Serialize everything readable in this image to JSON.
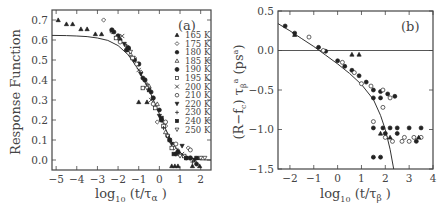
{
  "chart_data": [
    {
      "type": "scatter",
      "panel_label": "(a)",
      "xlabel": "log10 (t/τα)",
      "ylabel": "Response Function",
      "xlim": [
        -5.2,
        2.5
      ],
      "ylim": [
        -0.05,
        0.75
      ],
      "xticks": [
        -5,
        -4,
        -3,
        -2,
        -1,
        0,
        1,
        2
      ],
      "yticks": [
        0.0,
        0.1,
        0.2,
        0.3,
        0.4,
        0.5,
        0.6,
        0.7
      ],
      "ytick_labels": [
        "0.0",
        "0.1",
        "0.2",
        "0.3",
        "0.4",
        "0.5",
        "0.6",
        "0.7"
      ],
      "legend_position": "right",
      "legend": [
        "165 K",
        "175 K",
        "180 K",
        "185 K",
        "190 K",
        "195 K",
        "200 K",
        "210 K",
        "220 K",
        "230 K",
        "240 K",
        "250 K"
      ],
      "fit_curve": {
        "description": "stretched-exponential-like master curve",
        "x": [
          -5.2,
          -4.5,
          -4,
          -3.5,
          -3,
          -2.5,
          -2,
          -1.5,
          -1,
          -0.5,
          0,
          0.3,
          0.6,
          1.0,
          1.5,
          2.0,
          2.5
        ],
        "y": [
          0.623,
          0.622,
          0.62,
          0.617,
          0.61,
          0.598,
          0.572,
          0.525,
          0.45,
          0.35,
          0.23,
          0.155,
          0.09,
          0.035,
          0.008,
          0.001,
          0.0
        ]
      },
      "series": [
        {
          "name": "165 K",
          "marker": "triangle-filled",
          "points": [
            [
              -4.9,
              0.7
            ],
            [
              -4.5,
              0.68
            ],
            [
              -4.2,
              0.68
            ],
            [
              -3.8,
              0.655
            ],
            [
              -3.5,
              0.655
            ],
            [
              -3.1,
              0.63
            ],
            [
              -2.8,
              0.63
            ],
            [
              -1.0,
              0.29
            ],
            [
              -0.6,
              0.29
            ],
            [
              0.6,
              -0.03
            ],
            [
              0.75,
              -0.03
            ],
            [
              0.9,
              -0.03
            ],
            [
              1.6,
              -0.03
            ],
            [
              1.95,
              -0.03
            ]
          ]
        },
        {
          "name": "175 K",
          "marker": "diamond-open",
          "points": [
            [
              -2.7,
              0.7
            ],
            [
              -2.3,
              0.64
            ],
            [
              -1.6,
              0.57
            ],
            [
              -1.2,
              0.51
            ],
            [
              -0.9,
              0.44
            ],
            [
              -0.1,
              0.19
            ],
            [
              0.3,
              0.17
            ],
            [
              0.7,
              0.06
            ],
            [
              1.4,
              0.06
            ]
          ]
        },
        {
          "name": "180 K",
          "marker": "circle-filled",
          "points": [
            [
              -2.2,
              0.64
            ],
            [
              -1.9,
              0.6
            ],
            [
              -1.6,
              0.55
            ],
            [
              -1.2,
              0.5
            ],
            [
              -0.8,
              0.41
            ],
            [
              -0.4,
              0.34
            ],
            [
              0.0,
              0.25
            ],
            [
              0.4,
              0.12
            ],
            [
              0.8,
              0.03
            ],
            [
              1.3,
              0.01
            ],
            [
              1.8,
              -0.02
            ]
          ]
        },
        {
          "name": "185 K",
          "marker": "triangle-open",
          "points": [
            [
              -2.0,
              0.62
            ],
            [
              -1.4,
              0.53
            ],
            [
              -0.5,
              0.37
            ],
            [
              -0.1,
              0.28
            ],
            [
              0.3,
              0.14
            ],
            [
              1.0,
              0.03
            ],
            [
              1.7,
              0.0
            ]
          ]
        },
        {
          "name": "190 K",
          "marker": "hexagon-filled",
          "points": [
            [
              -2.3,
              0.65
            ],
            [
              -2.0,
              0.62
            ],
            [
              -1.5,
              0.56
            ],
            [
              -1.0,
              0.48
            ],
            [
              -0.7,
              0.4
            ],
            [
              -0.3,
              0.31
            ],
            [
              0.1,
              0.2
            ],
            [
              0.5,
              0.1
            ],
            [
              0.9,
              0.04
            ],
            [
              1.5,
              0.01
            ]
          ]
        },
        {
          "name": "195 K",
          "marker": "square-open",
          "points": [
            [
              -2.1,
              0.61
            ],
            [
              -1.3,
              0.51
            ],
            [
              -0.8,
              0.36
            ],
            [
              -0.2,
              0.26
            ],
            [
              0.2,
              0.17
            ],
            [
              0.6,
              0.06
            ],
            [
              1.2,
              0.02
            ]
          ]
        },
        {
          "name": "200 K",
          "marker": "cross",
          "points": [
            [
              -1.8,
              0.62
            ],
            [
              -1.0,
              0.45
            ],
            [
              -0.4,
              0.3
            ],
            [
              0.5,
              0.1
            ],
            [
              1.1,
              0.03
            ],
            [
              1.9,
              0.01
            ]
          ]
        },
        {
          "name": "210 K",
          "marker": "circle-open",
          "points": [
            [
              -1.9,
              0.59
            ],
            [
              -1.1,
              0.48
            ],
            [
              -0.3,
              0.28
            ],
            [
              0.3,
              0.19
            ],
            [
              0.8,
              0.08
            ],
            [
              1.5,
              0.05
            ]
          ]
        },
        {
          "name": "220 K",
          "marker": "triangle-down-filled",
          "points": [
            [
              -1.7,
              0.58
            ],
            [
              -0.9,
              0.43
            ],
            [
              0.0,
              0.22
            ],
            [
              0.6,
              0.08
            ],
            [
              1.1,
              0.07
            ],
            [
              1.7,
              0.0
            ]
          ]
        },
        {
          "name": "230 K",
          "marker": "plus",
          "points": [
            [
              -1.6,
              0.57
            ],
            [
              -0.6,
              0.38
            ],
            [
              0.2,
              0.16
            ],
            [
              0.9,
              0.05
            ],
            [
              1.6,
              -0.01
            ]
          ]
        },
        {
          "name": "240 K",
          "marker": "square-filled",
          "points": [
            [
              -1.5,
              0.55
            ],
            [
              -0.5,
              0.35
            ],
            [
              0.1,
              0.21
            ],
            [
              0.7,
              0.03
            ],
            [
              1.3,
              0.01
            ],
            [
              1.8,
              0.01
            ]
          ]
        },
        {
          "name": "250 K",
          "marker": "triangle-down-open",
          "points": [
            [
              -1.4,
              0.54
            ],
            [
              -0.6,
              0.36
            ],
            [
              0.4,
              0.12
            ],
            [
              1.0,
              0.02
            ],
            [
              2.0,
              0.01
            ],
            [
              2.2,
              0.01
            ]
          ]
        }
      ]
    },
    {
      "type": "scatter",
      "panel_label": "(b)",
      "xlabel": "log10 (t/τβ)",
      "ylabel": "(R−fc) τβ^a (ps^a)",
      "xlim": [
        -2.5,
        4
      ],
      "ylim": [
        -1.5,
        0.5
      ],
      "xticks": [
        -2,
        -1,
        0,
        1,
        2,
        3,
        4
      ],
      "yticks": [
        0.5,
        0.0,
        -0.5,
        -1.0,
        -1.5
      ],
      "ytick_labels": [
        "0.5",
        "0.0",
        "−0.5",
        "−1.0",
        "−1.5"
      ],
      "reference_line_y": 0.0,
      "fit_curve": {
        "description": "beta-relaxation critical decay master curve",
        "x": [
          -2.5,
          -2,
          -1.5,
          -1,
          -0.5,
          0,
          0.5,
          1,
          1.5,
          1.8,
          2.0,
          2.2,
          2.35
        ],
        "y": [
          0.34,
          0.25,
          0.15,
          0.05,
          -0.06,
          -0.17,
          -0.29,
          -0.43,
          -0.62,
          -0.82,
          -1.0,
          -1.25,
          -1.5
        ]
      },
      "series": [
        {
          "name": "low T (filled)",
          "marker": "circle-filled",
          "points": [
            [
              -2.2,
              0.31
            ],
            [
              -1.8,
              0.22
            ],
            [
              -0.8,
              0.04
            ],
            [
              -0.5,
              -0.01
            ],
            [
              0.0,
              -0.13
            ],
            [
              0.3,
              -0.2
            ],
            [
              0.6,
              -0.25
            ],
            [
              0.9,
              -0.32
            ],
            [
              1.2,
              -0.4
            ],
            [
              1.5,
              -0.5
            ],
            [
              1.8,
              -0.52
            ],
            [
              2.1,
              -0.55
            ],
            [
              2.4,
              -0.58
            ],
            [
              1.5,
              -0.98
            ],
            [
              1.9,
              -0.98
            ],
            [
              2.2,
              -0.98
            ],
            [
              2.5,
              -0.98
            ],
            [
              3.0,
              -0.98
            ],
            [
              3.5,
              -0.98
            ],
            [
              2.0,
              -1.05
            ],
            [
              2.5,
              -1.05
            ],
            [
              3.3,
              -1.15
            ],
            [
              1.5,
              -1.35
            ],
            [
              1.8,
              -1.35
            ],
            [
              1.5,
              -0.6
            ],
            [
              1.8,
              -0.6
            ]
          ]
        },
        {
          "name": "high T (open)",
          "marker": "circle-open",
          "points": [
            [
              -1.2,
              0.17
            ],
            [
              -0.6,
              0.0
            ],
            [
              0.2,
              -0.15
            ],
            [
              0.7,
              -0.28
            ],
            [
              1.0,
              -0.42
            ],
            [
              1.4,
              -0.45
            ],
            [
              1.9,
              -0.5
            ],
            [
              2.2,
              -0.6
            ],
            [
              1.5,
              -0.9
            ],
            [
              1.9,
              -0.72
            ],
            [
              2.0,
              -1.1
            ],
            [
              2.3,
              -1.15
            ],
            [
              2.7,
              -1.15
            ],
            [
              3.0,
              -1.15
            ],
            [
              2.8,
              -1.1
            ],
            [
              3.2,
              -1.1
            ],
            [
              3.5,
              -1.1
            ]
          ]
        },
        {
          "name": "intermediate (triangles)",
          "marker": "triangle-filled",
          "points": [
            [
              -1.8,
              0.2
            ],
            [
              0.6,
              -0.05
            ],
            [
              0.9,
              -0.05
            ],
            [
              1.8,
              -1.05
            ],
            [
              2.2,
              -1.1
            ],
            [
              3.4,
              -1.1
            ]
          ]
        }
      ]
    }
  ],
  "labels": {
    "a_panel": "(a)",
    "b_panel": "(b)",
    "a_ylabel": "Response Function",
    "b_ylabel_main": "(R−f",
    "b_ylabel_c": "c",
    "b_ylabel_close": ") τ",
    "b_ylabel_beta": "β",
    "b_ylabel_a": "a",
    "b_ylabel_ps": " (ps",
    "b_ylabel_psa": "a",
    "b_ylabel_end": ")",
    "x_log": "log",
    "x_10": "10",
    "a_x_arg": " (t/τ",
    "a_x_sub": "α",
    "b_x_sub": "β",
    "x_close": " )"
  }
}
